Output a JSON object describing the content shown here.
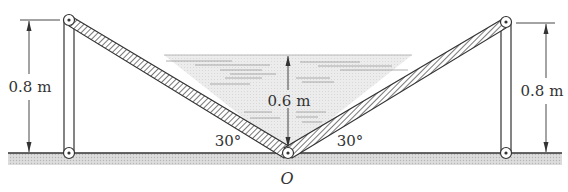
{
  "figure": {
    "colors": {
      "ink": "#333333",
      "water": "#e4e4e4",
      "ground": "#d0d0d0",
      "plate_hatch": "#555555"
    }
  },
  "labels": {
    "left_height": "0.8 m",
    "right_height": "0.8 m",
    "water_depth": "0.6 m",
    "left_angle": "30°",
    "right_angle": "30°",
    "hinge": "O"
  },
  "geometry": {
    "ground_y": 153,
    "hinge_O": [
      288,
      153
    ],
    "left_top_pin": [
      69,
      20
    ],
    "left_bottom_pin": [
      69,
      153
    ],
    "right_top_pin": [
      506,
      22
    ],
    "right_bottom_pin": [
      506,
      153
    ],
    "water_surface_y": 55
  }
}
